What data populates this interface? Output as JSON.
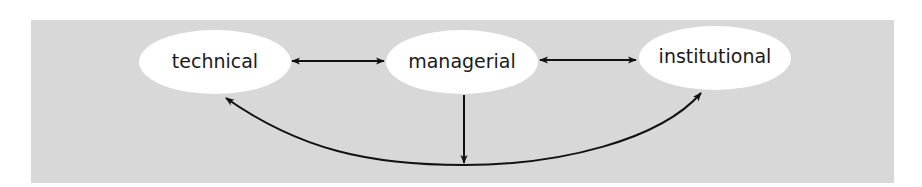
{
  "diagram": {
    "colors": {
      "background": "#d8d8d8",
      "node_fill": "#ffffff",
      "edge": "#111111",
      "text": "#1a1a1a"
    },
    "nodes": [
      {
        "id": "technical",
        "label": "technical",
        "cx": 215,
        "cy": 62,
        "rx": 76,
        "ry": 32
      },
      {
        "id": "managerial",
        "label": "managerial",
        "cx": 462,
        "cy": 62,
        "rx": 76,
        "ry": 32
      },
      {
        "id": "institutional",
        "label": "institutional",
        "cx": 715,
        "cy": 58,
        "rx": 76,
        "ry": 32
      }
    ],
    "edges": [
      {
        "from": "technical",
        "to": "managerial",
        "type": "bidirectional"
      },
      {
        "from": "managerial",
        "to": "institutional",
        "type": "bidirectional"
      },
      {
        "from": "managerial",
        "to": "technical-institutional-curve",
        "type": "directed"
      },
      {
        "from": "technical",
        "to": "institutional",
        "type": "bidirectional-curved"
      }
    ]
  }
}
